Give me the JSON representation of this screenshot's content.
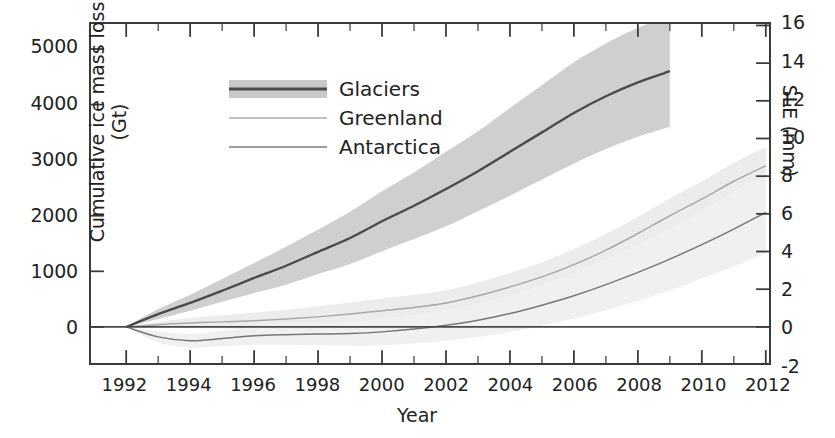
{
  "axes": {
    "y_left_title": "Cumulative ice mass loss (Gt)",
    "y_right_title": "SLE (mm)",
    "x_title": "Year",
    "y_left_ticks": [
      "0",
      "1000",
      "2000",
      "3000",
      "4000",
      "5000"
    ],
    "y_right_ticks": [
      "-2",
      "0",
      "2",
      "4",
      "6",
      "8",
      "10",
      "12",
      "14",
      "16"
    ],
    "x_ticks": [
      "1992",
      "1994",
      "1996",
      "1998",
      "2000",
      "2002",
      "2004",
      "2006",
      "2008",
      "2010",
      "2012"
    ]
  },
  "legend": {
    "items": [
      {
        "label": "Glaciers",
        "color": "#4a4a4a",
        "band": "#c9c9c9"
      },
      {
        "label": "Greenland",
        "color": "#9a9a9a",
        "band": "#e4e4e4"
      },
      {
        "label": "Antarctica",
        "color": "#6f6f6f",
        "band": "#e9e9e9"
      }
    ]
  },
  "chart_data": {
    "type": "line",
    "title": "",
    "xlabel": "Year",
    "ylabel": "Cumulative ice mass loss (Gt)",
    "y2label": "SLE (mm)",
    "xlim": [
      1990.9,
      2012.1
    ],
    "ylim": [
      -650,
      5450
    ],
    "y2lim": [
      -2,
      16
    ],
    "grid": false,
    "legend_position": "top-left",
    "x": [
      1992,
      1993,
      1994,
      1995,
      1996,
      1997,
      1998,
      1999,
      2000,
      2001,
      2002,
      2003,
      2004,
      2005,
      2006,
      2007,
      2008,
      2009,
      2010,
      2011,
      2012
    ],
    "series": [
      {
        "name": "Glaciers",
        "values": [
          0,
          230,
          430,
          650,
          880,
          1100,
          1350,
          1600,
          1900,
          2180,
          2480,
          2800,
          3150,
          3500,
          3850,
          4150,
          4400,
          4600,
          null,
          null,
          null
        ],
        "band_low": [
          0,
          140,
          290,
          450,
          610,
          760,
          950,
          1130,
          1360,
          1580,
          1810,
          2080,
          2360,
          2650,
          2940,
          3200,
          3420,
          3600,
          null,
          null,
          null
        ],
        "band_high": [
          0,
          320,
          580,
          860,
          1150,
          1440,
          1750,
          2070,
          2440,
          2780,
          3150,
          3520,
          3940,
          4350,
          4760,
          5100,
          5380,
          5600,
          null,
          null,
          null
        ]
      },
      {
        "name": "Greenland",
        "values": [
          0,
          40,
          70,
          90,
          110,
          140,
          180,
          230,
          290,
          350,
          430,
          560,
          720,
          900,
          1120,
          1380,
          1680,
          2000,
          2300,
          2620,
          2900
        ],
        "band_low": [
          0,
          -10,
          -20,
          -30,
          -40,
          -30,
          -10,
          20,
          70,
          120,
          200,
          320,
          470,
          640,
          840,
          1090,
          1380,
          1690,
          1980,
          2290,
          2560
        ],
        "band_high": [
          0,
          90,
          160,
          210,
          260,
          310,
          370,
          440,
          510,
          580,
          660,
          800,
          970,
          1160,
          1400,
          1670,
          1980,
          2310,
          2620,
          2950,
          3240
        ]
      },
      {
        "name": "Antarctica",
        "values": [
          0,
          -180,
          -250,
          -210,
          -160,
          -140,
          -130,
          -120,
          -90,
          -40,
          30,
          120,
          240,
          390,
          560,
          760,
          980,
          1220,
          1480,
          1760,
          2060
        ],
        "band_low": [
          0,
          -280,
          -370,
          -350,
          -320,
          -320,
          -330,
          -340,
          -330,
          -300,
          -250,
          -180,
          -90,
          20,
          150,
          300,
          470,
          660,
          870,
          1090,
          1330
        ],
        "band_high": [
          0,
          -80,
          -130,
          -70,
          0,
          60,
          70,
          100,
          150,
          220,
          310,
          420,
          570,
          760,
          970,
          1220,
          1490,
          1780,
          2090,
          2430,
          2790
        ]
      }
    ]
  }
}
